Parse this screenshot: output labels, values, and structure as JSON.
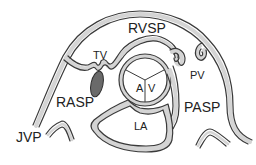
{
  "diagram": {
    "title": "",
    "labels": {
      "rvsp": "RVSP",
      "tv": "TV",
      "a": "A",
      "v": "V",
      "pv": "PV",
      "rasp": "RASP",
      "pasp": "PASP",
      "la": "LA",
      "jvp": "JVP"
    },
    "colors": {
      "wall_fill": "#d4d4d4",
      "outline": "#3a3a3a",
      "thrombus": "#6a6a6a",
      "background": "#ffffff"
    }
  }
}
